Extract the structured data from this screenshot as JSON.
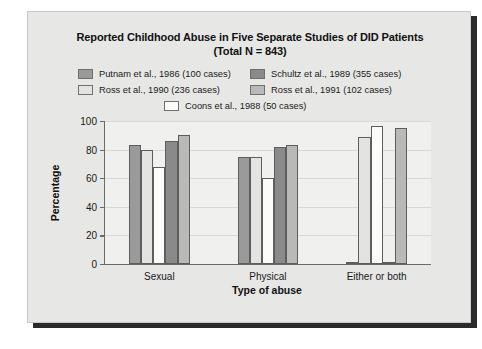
{
  "figure": {
    "background_color": "#ffffff",
    "panel_color": "#e7e7e5",
    "plot_background_color": "#f0f0ee",
    "shadow_color": "#2b2b2b",
    "axis_color": "#6a6a6a",
    "grid_color": "#d8d8d4"
  },
  "title": {
    "line1": "Reported Childhood Abuse in Five Separate Studies of DID Patients",
    "line2": "(Total N = 843)"
  },
  "legend": {
    "rows": [
      [
        {
          "label": "Putnam et al., 1986 (100 cases)",
          "color": "#9a9a9a"
        },
        {
          "label": "Schultz et al., 1989 (355 cases)",
          "color": "#8a8a8a"
        }
      ],
      [
        {
          "label": "Ross et al., 1990 (236 cases)",
          "color": "#e3e3e1"
        },
        {
          "label": "Ross et al., 1991 (102 cases)",
          "color": "#b9b9b7"
        }
      ],
      [
        {
          "label": "Coons et al., 1988 (50 cases)",
          "color": "#fbfbfa"
        }
      ]
    ]
  },
  "axes": {
    "ylabel": "Percentage",
    "xlabel": "Type of abuse",
    "yticks": [
      "0",
      "20",
      "40",
      "60",
      "80",
      "100"
    ],
    "ytick_values": [
      0,
      20,
      40,
      60,
      80,
      100
    ],
    "ylim": [
      0,
      100
    ]
  },
  "chart_data": {
    "type": "bar",
    "title": "Reported Childhood Abuse in Five Separate Studies of DID Patients (Total N = 843)",
    "xlabel": "Type of abuse",
    "ylabel": "Percentage",
    "ylim": [
      0,
      100
    ],
    "grid": true,
    "legend_position": "top-center",
    "categories": [
      "Sexual",
      "Physical",
      "Either or both"
    ],
    "series": [
      {
        "name": "Putnam et al., 1986 (100 cases)",
        "color": "#9a9a9a",
        "values": [
          83,
          75,
          1.5
        ]
      },
      {
        "name": "Ross et al., 1990 (236 cases)",
        "color": "#e3e3e1",
        "values": [
          79.5,
          75,
          88.5
        ]
      },
      {
        "name": "Coons et al., 1988 (50 cases)",
        "color": "#fbfbfa",
        "values": [
          68,
          60,
          96.5
        ]
      },
      {
        "name": "Schultz et al., 1989 (355 cases)",
        "color": "#8a8a8a",
        "values": [
          86,
          82,
          1.5
        ]
      },
      {
        "name": "Ross et al., 1991 (102 cases)",
        "color": "#b9b9b7",
        "values": [
          90.5,
          83,
          95
        ]
      }
    ]
  }
}
